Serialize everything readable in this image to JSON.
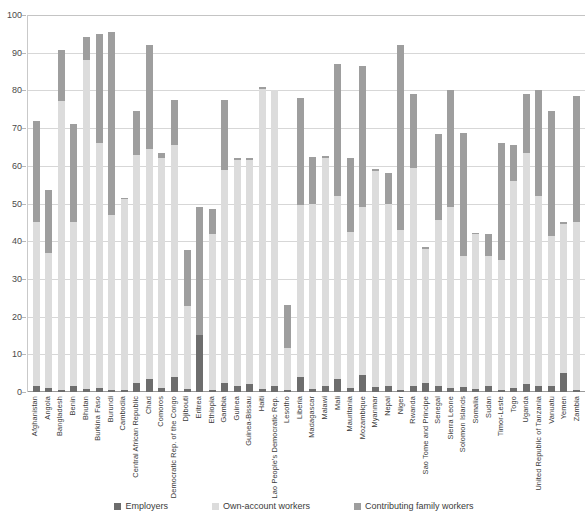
{
  "chart_data": {
    "type": "bar",
    "stacked": true,
    "title": "",
    "subtitle": "",
    "xlabel": "",
    "ylabel": "",
    "ylim": [
      0,
      100
    ],
    "yticks": [
      0,
      10,
      20,
      30,
      40,
      50,
      60,
      70,
      80,
      90,
      100
    ],
    "grid": true,
    "legend_position": "bottom",
    "categories": [
      "Afghanistan",
      "Angola",
      "Bangladesh",
      "Benin",
      "Bhutan",
      "Burkina Faso",
      "Burundi",
      "Cambodia",
      "Central African Republic",
      "Chad",
      "Comoros",
      "Democratic Rep. of the Congo",
      "Djibouti",
      "Eritrea",
      "Ethiopia",
      "Gambia",
      "Guinea",
      "Guinea-Bissau",
      "Haiti",
      "Lao People's Democratic Rep.",
      "Lesotho",
      "Liberia",
      "Madagascar",
      "Malawi",
      "Mali",
      "Mauritania",
      "Mozambique",
      "Myanmar",
      "Nepal",
      "Niger",
      "Rwanda",
      "Sao Tome and Principe",
      "Senegal",
      "Sierra Leone",
      "Solomon Islands",
      "Somalia",
      "Sudan",
      "Timor-Leste",
      "Togo",
      "Uganda",
      "United Republic of Tanzania",
      "Vanuatu",
      "Yemen",
      "Zambia"
    ],
    "series": [
      {
        "name": "Employers",
        "color": "#6d6d6d",
        "values": [
          1.5,
          1.0,
          0.6,
          1.5,
          0.7,
          1.0,
          0.5,
          0.6,
          2.5,
          3.5,
          1.0,
          4.0,
          0.8,
          15.0,
          0.5,
          2.5,
          1.5,
          2.0,
          0.8,
          1.5,
          0.6,
          4.0,
          0.8,
          1.5,
          3.5,
          1.0,
          4.5,
          1.2,
          1.5,
          0.6,
          1.5,
          2.5,
          1.5,
          1.0,
          1.2,
          0.8,
          1.5,
          0.6,
          1.0,
          2.0,
          1.5,
          1.5,
          5.0,
          0.6
        ]
      },
      {
        "name": "Own-account workers",
        "color": "#dcdcdc",
        "values": [
          43.5,
          36.0,
          76.5,
          43.5,
          87.5,
          65.0,
          46.5,
          50.5,
          60.5,
          61.0,
          61.0,
          61.5,
          22.0,
          0.0,
          41.5,
          56.5,
          60.0,
          59.5,
          79.5,
          78.5,
          11.0,
          45.5,
          49.0,
          60.5,
          48.5,
          41.5,
          44.5,
          57.5,
          48.5,
          42.5,
          58.0,
          35.5,
          44.0,
          48.0,
          35.0,
          41.0,
          34.5,
          34.5,
          55.0,
          61.5,
          50.5,
          40.0,
          39.5,
          44.5
        ]
      },
      {
        "name": "Contributing family workers",
        "color": "#9e9e9e",
        "values": [
          27.0,
          16.5,
          13.5,
          26.0,
          6.0,
          29.0,
          48.5,
          0.5,
          11.5,
          27.5,
          1.5,
          12.0,
          15.0,
          34.0,
          6.5,
          18.5,
          0.5,
          0.5,
          0.5,
          0.0,
          11.5,
          28.5,
          12.5,
          0.5,
          35.0,
          19.5,
          37.5,
          0.5,
          8.0,
          49.0,
          19.5,
          0.5,
          23.0,
          31.0,
          32.5,
          0.5,
          6.0,
          31.0,
          9.5,
          15.5,
          28.0,
          33.0,
          0.5,
          33.5
        ]
      }
    ]
  },
  "legend": {
    "items": [
      {
        "label": "Employers",
        "color": "#6d6d6d",
        "swatch_name": "legend-swatch-employers"
      },
      {
        "label": "Own-account workers",
        "color": "#dcdcdc",
        "swatch_name": "legend-swatch-own-account"
      },
      {
        "label": "Contributing family workers",
        "color": "#9e9e9e",
        "swatch_name": "legend-swatch-contributing-family"
      }
    ]
  },
  "colors": {
    "employers": "#6d6d6d",
    "own_account": "#dcdcdc",
    "contributing_family": "#9e9e9e",
    "gridline": "#d7d7d7",
    "axis": "#9a9a9a",
    "text": "#3b3b3b",
    "background": "#ffffff"
  }
}
